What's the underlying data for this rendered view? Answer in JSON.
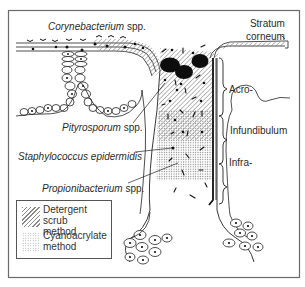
{
  "figure": {
    "labels": {
      "corynebacterium": {
        "species": "Corynebacterium",
        "suffix": " spp."
      },
      "stratum_corneum": {
        "line1": "Stratum",
        "line2": "corneum"
      },
      "acro": "Acro-",
      "infundibulum": "Infundibulum",
      "infra": "Infra-",
      "pityrosporum": {
        "species": "Pityrosporum",
        "suffix": " spp."
      },
      "staphylococcus": {
        "species": "Staphylococcus epidermidis"
      },
      "propionibacterium": {
        "species": "Propionibacterium",
        "suffix": " spp."
      }
    },
    "legend": {
      "items": [
        {
          "pattern": "diagonal-hatch",
          "line1": "Detergent scrub",
          "line2": "method"
        },
        {
          "pattern": "stipple-dots",
          "line1": "Cyanoacrylate",
          "line2": "method"
        }
      ]
    },
    "colors": {
      "ink": "#1a1a1a",
      "frame": "#6a6a6a",
      "background": "#ffffff",
      "hatch": "#8a8a8a",
      "stipple": "#9a9a9a"
    }
  }
}
